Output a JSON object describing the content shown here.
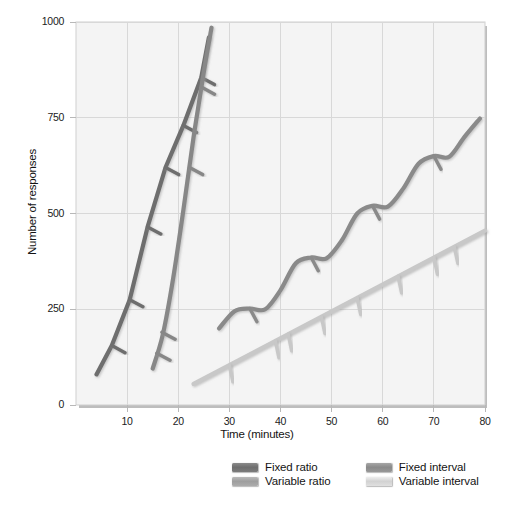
{
  "chart_data": {
    "type": "line",
    "title": "",
    "xlabel": "Time (minutes)",
    "ylabel": "Number of responses",
    "xlim": [
      0,
      80
    ],
    "ylim": [
      0,
      1000
    ],
    "xticks": [
      10,
      20,
      30,
      40,
      50,
      60,
      70,
      80
    ],
    "yticks": [
      0,
      250,
      500,
      750,
      1000
    ],
    "grid": true,
    "legend_position": "bottom",
    "series": [
      {
        "name": "Fixed ratio",
        "color": "#6e6e6e",
        "style": "stepped-staircase-with-reinforcement-hashmarks",
        "x": [
          4,
          7,
          7,
          10.5,
          10.5,
          14,
          14,
          17.5,
          17.5,
          21,
          21,
          24.5,
          24.5,
          26
        ],
        "y": [
          80,
          155,
          155,
          275,
          275,
          465,
          465,
          620,
          620,
          730,
          730,
          855,
          855,
          960
        ],
        "hashmarks": [
          {
            "x": 7,
            "y": 155
          },
          {
            "x": 10.5,
            "y": 275
          },
          {
            "x": 14,
            "y": 465
          },
          {
            "x": 17.5,
            "y": 620
          },
          {
            "x": 21,
            "y": 730
          },
          {
            "x": 24.5,
            "y": 855
          }
        ]
      },
      {
        "name": "Variable ratio",
        "color": "#878787",
        "style": "smooth-steep-line-with-hashmarks",
        "x": [
          15,
          17,
          19,
          21,
          23,
          25,
          26.5
        ],
        "y": [
          95,
          185,
          330,
          510,
          700,
          870,
          985
        ],
        "hashmarks": [
          {
            "x": 15.8,
            "y": 135
          },
          {
            "x": 16.8,
            "y": 190
          },
          {
            "x": 22.2,
            "y": 620
          },
          {
            "x": 24.5,
            "y": 830
          }
        ]
      },
      {
        "name": "Fixed interval",
        "color": "#8a8a8a",
        "style": "scalloped-curve-with-hashmarks",
        "x": [
          28,
          31,
          34,
          37,
          40,
          43,
          46,
          49,
          52,
          55,
          58,
          61,
          64,
          67,
          70,
          73,
          76,
          79
        ],
        "y": [
          200,
          245,
          252,
          250,
          300,
          370,
          385,
          383,
          430,
          500,
          520,
          518,
          565,
          630,
          650,
          648,
          700,
          748
        ],
        "scallop_peaks": [
          {
            "x": 34,
            "y": 252
          },
          {
            "x": 46,
            "y": 385
          },
          {
            "x": 58,
            "y": 520
          },
          {
            "x": 70,
            "y": 650
          },
          {
            "x": 79,
            "y": 748
          }
        ],
        "hashmarks": [
          {
            "x": 34,
            "y": 252
          },
          {
            "x": 46,
            "y": 385
          },
          {
            "x": 58,
            "y": 520
          },
          {
            "x": 70,
            "y": 650
          }
        ]
      },
      {
        "name": "Variable interval",
        "color": "#c8c8c8",
        "style": "straight-line-with-hashmarks",
        "x": [
          23,
          80
        ],
        "y": [
          55,
          455
        ],
        "hashmarks": [
          {
            "x": 30,
            "y": 104
          },
          {
            "x": 39,
            "y": 167
          },
          {
            "x": 41.5,
            "y": 185
          },
          {
            "x": 48,
            "y": 230
          },
          {
            "x": 55,
            "y": 280
          },
          {
            "x": 63,
            "y": 336
          },
          {
            "x": 70,
            "y": 385
          },
          {
            "x": 74,
            "y": 413
          }
        ]
      }
    ]
  },
  "colors": {
    "plot_background": "#f4f4f4",
    "grid": "#d6d6d6",
    "axis_text": "#1b1b1b",
    "plot_border": "#c9c9c9",
    "shadow": "#bdbdbd"
  },
  "legend": {
    "entries": [
      {
        "label": "Fixed ratio",
        "color": "#6e6e6e"
      },
      {
        "label": "Fixed interval",
        "color": "#8a8a8a"
      },
      {
        "label": "Variable ratio",
        "color": "#9e9e9e"
      },
      {
        "label": "Variable interval",
        "color": "#d2d2d2"
      }
    ]
  }
}
